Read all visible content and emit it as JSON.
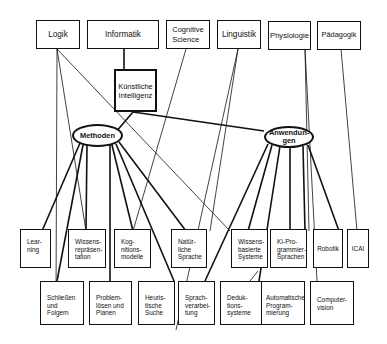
{
  "diagram": {
    "type": "concept-map",
    "top_disciplines": [
      {
        "id": "logik",
        "label": "Logik"
      },
      {
        "id": "informatik",
        "label": "Informatik"
      },
      {
        "id": "cognitive",
        "label": "Cognitive\nScience"
      },
      {
        "id": "linguistik",
        "label": "Linguistik"
      },
      {
        "id": "physiologie",
        "label": "Physiologie"
      },
      {
        "id": "paedagogik",
        "label": "Pädagogik"
      }
    ],
    "center": {
      "id": "ki",
      "label": "Künstliche\nIntelligenz"
    },
    "hubs": [
      {
        "id": "methoden",
        "label": "Methoden"
      },
      {
        "id": "anwendungen",
        "label": "Anwendun-\ngen"
      }
    ],
    "row1": [
      {
        "id": "learning",
        "label": "Lear-\nning"
      },
      {
        "id": "wissensrep",
        "label": "Wissens-\nrepräsen-\ntation"
      },
      {
        "id": "kognition",
        "label": "Kog-\nnitions-\nmodelle"
      },
      {
        "id": "natsprache",
        "label": "Natür-\nliche\nSprache"
      },
      {
        "id": "wbs",
        "label": "Wissens-\nbasierte\nSysteme"
      },
      {
        "id": "kiprog",
        "label": "KI-Pro-\ngrammier-\nSprachen"
      },
      {
        "id": "robotik",
        "label": "Robotik"
      },
      {
        "id": "icai",
        "label": "ICAI"
      }
    ],
    "row2": [
      {
        "id": "schliessen",
        "label": "Schließen\nund\nFolgern"
      },
      {
        "id": "problem",
        "label": "Problem-\nlösen und\nPlanen"
      },
      {
        "id": "heuristisch",
        "label": "Heuris-\ntische\nSuche"
      },
      {
        "id": "sprachverarb",
        "label": "Sprach-\nverarbei-\ntung"
      },
      {
        "id": "deduktion",
        "label": "Deduk-\ntions-\nsysteme"
      },
      {
        "id": "autoprog",
        "label": "Automatische\nProgram-\nmierung"
      },
      {
        "id": "computervision",
        "label": "Computer-\nvision"
      }
    ],
    "edges": [
      [
        "informatik",
        "ki"
      ],
      [
        "ki",
        "methoden"
      ],
      [
        "ki",
        "anwendungen"
      ],
      [
        "logik",
        "schliessen"
      ],
      [
        "logik",
        "wissensrep"
      ],
      [
        "logik",
        "wbs"
      ],
      [
        "cognitive",
        "kognition"
      ],
      [
        "linguistik",
        "natsprache"
      ],
      [
        "linguistik",
        "sprachverarb"
      ],
      [
        "physiologie",
        "robotik"
      ],
      [
        "physiologie",
        "computervision"
      ],
      [
        "paedagogik",
        "icai"
      ],
      [
        "methoden",
        "learning"
      ],
      [
        "methoden",
        "schliessen"
      ],
      [
        "methoden",
        "wissensrep"
      ],
      [
        "methoden",
        "problem"
      ],
      [
        "methoden",
        "kognition"
      ],
      [
        "methoden",
        "heuristisch"
      ],
      [
        "methoden",
        "natsprache"
      ],
      [
        "anwendungen",
        "sprachverarb"
      ],
      [
        "anwendungen",
        "wbs"
      ],
      [
        "anwendungen",
        "autoprog"
      ],
      [
        "anwendungen",
        "kiprog"
      ],
      [
        "anwendungen",
        "robotik"
      ],
      [
        "anwendungen",
        "icai"
      ]
    ]
  }
}
